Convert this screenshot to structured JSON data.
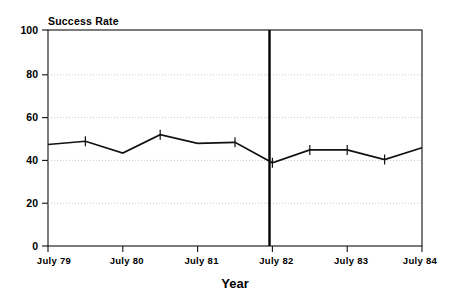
{
  "chart_data": {
    "type": "line",
    "title": "Success Rate",
    "xlabel": "Year",
    "ylabel": "",
    "ylim": [
      0,
      100
    ],
    "yticks": [
      0,
      20,
      40,
      60,
      80,
      100
    ],
    "ytick_labels": [
      "0",
      "20",
      "40",
      "60",
      "80",
      "100"
    ],
    "xtick_labels": [
      "July 79",
      "July 80",
      "July 81",
      "July 82",
      "July 83",
      "July 84"
    ],
    "grid": "horizontal-dotted",
    "legend": "none",
    "x": [
      "July 79",
      "Jan 80",
      "July 80",
      "Jan 81",
      "July 81",
      "Jan 82",
      "July 82",
      "Jan 83",
      "July 83",
      "Jan 84",
      "July 84"
    ],
    "values": [
      47,
      48.5,
      43,
      51.5,
      47.5,
      48,
      38.5,
      44.5,
      44.5,
      40,
      45.5
    ],
    "markers": "plus-tick",
    "annotations": [
      {
        "type": "vertical-line",
        "x": "July 82",
        "label": ""
      }
    ]
  },
  "axis": {
    "title_text": "Success Rate",
    "x_axis_label": "Year",
    "y_max_label": "100",
    "y_min_label": "0"
  },
  "colors": {
    "line": "#111111",
    "grid": "#b9b9b9",
    "frame": "#111111",
    "reference_line": "#000000",
    "background": "#ffffff"
  }
}
